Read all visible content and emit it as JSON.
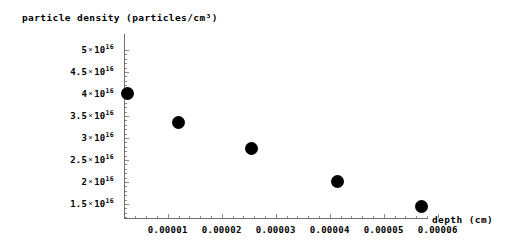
{
  "chart_data": {
    "type": "scatter",
    "title": "",
    "ylabel": "particle density (particles/cm³)",
    "xlabel": "depth (cm)",
    "grid": false,
    "legend": "none",
    "xlim": [
      0,
      6.4e-05
    ],
    "ylim": [
      1.2e+16,
      5.1e+16
    ],
    "x": [
      2.6e-06,
      1.19e-05,
      2.55e-05,
      4.15e-05,
      5.7e-05
    ],
    "y": [
      4e+16,
      3.35e+16,
      2.75e+16,
      2e+16,
      1.45e+16
    ],
    "points": [
      {
        "x": 2.6e-06,
        "y": 4e+16
      },
      {
        "x": 1.19e-05,
        "y": 3.35e+16
      },
      {
        "x": 2.55e-05,
        "y": 2.75e+16
      },
      {
        "x": 4.15e-05,
        "y": 2e+16
      },
      {
        "x": 5.7e-05,
        "y": 1.45e+16
      }
    ],
    "marker": {
      "shape": "circle",
      "color": "#000000",
      "size": 13
    },
    "yticks": [
      {
        "value": 5e+16,
        "mantissa": "5",
        "base": "10",
        "exponent": "16"
      },
      {
        "value": 4.5e+16,
        "mantissa": "4.5",
        "base": "10",
        "exponent": "16"
      },
      {
        "value": 4e+16,
        "mantissa": "4",
        "base": "10",
        "exponent": "16"
      },
      {
        "value": 3.5e+16,
        "mantissa": "3.5",
        "base": "10",
        "exponent": "16"
      },
      {
        "value": 3e+16,
        "mantissa": "3",
        "base": "10",
        "exponent": "16"
      },
      {
        "value": 2.5e+16,
        "mantissa": "2.5",
        "base": "10",
        "exponent": "16"
      },
      {
        "value": 2e+16,
        "mantissa": "2",
        "base": "10",
        "exponent": "16"
      },
      {
        "value": 1.5e+16,
        "mantissa": "1.5",
        "base": "10",
        "exponent": "16"
      }
    ],
    "xticks": [
      {
        "value": 1e-05,
        "label": "0.00001"
      },
      {
        "value": 2e-05,
        "label": "0.00002"
      },
      {
        "value": 3e-05,
        "label": "0.00003"
      },
      {
        "value": 4e-05,
        "label": "0.00004"
      },
      {
        "value": 5e-05,
        "label": "0.00005"
      },
      {
        "value": 6e-05,
        "label": "0.00006"
      }
    ],
    "times_symbol": "×",
    "axis_color": "#6f6f6f",
    "background_color": "#ffffff"
  },
  "geometry": {
    "origin_x_px": 124,
    "origin_y_px": 218,
    "y_axis_top_px": 34,
    "x_axis_right_px": 428,
    "px_per_x_unit": 5400000,
    "px_per_y_unit": 4.4e-15,
    "x_value_at_origin": 1.9e-06,
    "y_value_at_baseline": 1.18e+16
  }
}
